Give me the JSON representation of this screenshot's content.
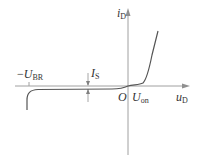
{
  "diagram": {
    "axes": {
      "y_label": {
        "main": "i",
        "sub": "D"
      },
      "x_label": {
        "main": "u",
        "sub": "D"
      },
      "origin": "O"
    },
    "annotations": {
      "breakdown": {
        "prefix": "−",
        "main": "U",
        "sub": "BR"
      },
      "saturation_current": {
        "main": "I",
        "sub": "S"
      },
      "turn_on": {
        "main": "U",
        "sub": "on"
      }
    },
    "colors": {
      "axis": "#9a9a9a",
      "curve": "#555555",
      "text": "#333333"
    }
  }
}
